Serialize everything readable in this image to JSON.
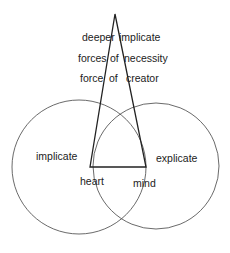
{
  "diagram": {
    "triangle_labels": {
      "row1": {
        "left": "deeper",
        "right": "implicate"
      },
      "row2": {
        "left": "forces",
        "middle": "of",
        "right": "necessity"
      },
      "row3": {
        "left": "force",
        "middle": "of",
        "right": "creator"
      }
    },
    "circles": {
      "left": {
        "label": "implicate"
      },
      "right": {
        "label": "explicate"
      }
    },
    "base_labels": {
      "left": "heart",
      "right": "mind"
    },
    "colors": {
      "stroke": "#333333",
      "text": "#222222",
      "background": "#ffffff"
    }
  }
}
